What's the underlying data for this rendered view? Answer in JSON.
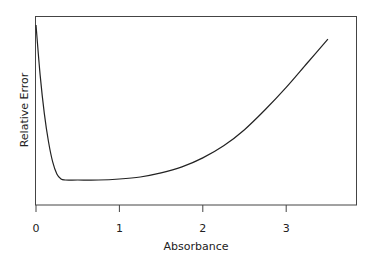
{
  "chart_data": {
    "type": "line",
    "title": "",
    "xlabel": "Absorbance",
    "ylabel": "Relative Error",
    "xlim": [
      0,
      3.85
    ],
    "ylim": [
      0,
      1
    ],
    "grid": false,
    "legend": null,
    "x_ticks": [
      0,
      1,
      2,
      3
    ],
    "x_tick_labels": [
      "0",
      "1",
      "2",
      "3"
    ],
    "y_ticks": [],
    "series": [
      {
        "name": "Relative Error",
        "x": [
          0.0,
          0.05,
          0.1,
          0.15,
          0.2,
          0.25,
          0.3,
          0.35,
          0.5,
          0.75,
          1.0,
          1.25,
          1.5,
          1.75,
          2.0,
          2.25,
          2.5,
          2.75,
          3.0,
          3.25,
          3.5
        ],
        "y": [
          0.97,
          0.72,
          0.53,
          0.39,
          0.29,
          0.23,
          0.205,
          0.2,
          0.2,
          0.2,
          0.205,
          0.215,
          0.235,
          0.265,
          0.31,
          0.37,
          0.45,
          0.55,
          0.66,
          0.78,
          0.9
        ]
      }
    ]
  },
  "labels": {
    "xlabel": "Absorbance",
    "ylabel": "Relative Error",
    "ticks": [
      "0",
      "1",
      "2",
      "3"
    ]
  }
}
